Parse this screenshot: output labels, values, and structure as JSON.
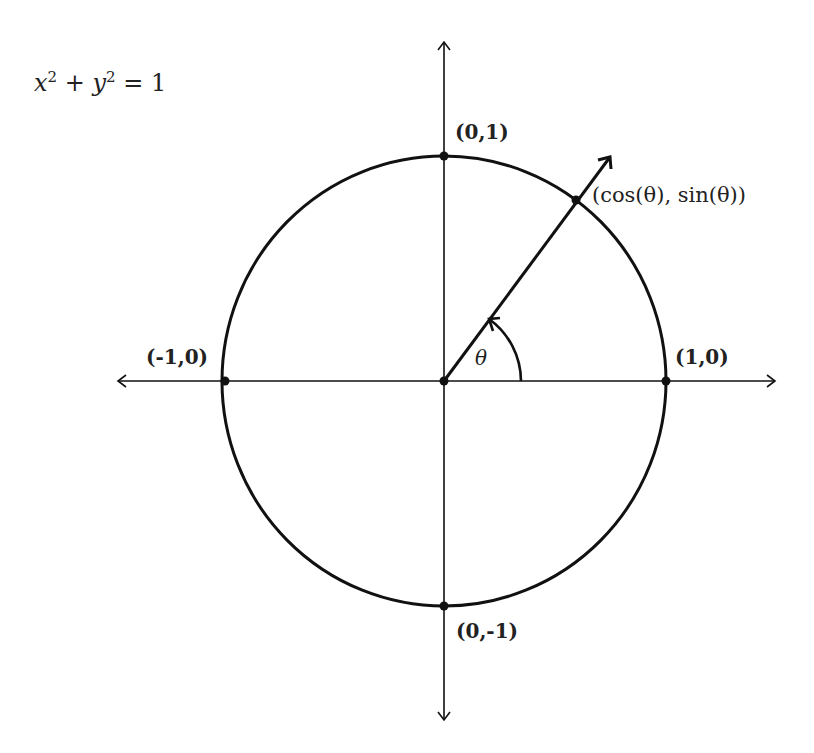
{
  "equation": {
    "x": "x",
    "y": "y",
    "exp": "2",
    "plus": " + ",
    "equals": " = 1"
  },
  "points": {
    "top": "(0,1)",
    "bottom": "(0,-1)",
    "left": "(-1,0)",
    "right": "(1,0)",
    "on_circle": "(cos(θ), sin(θ))"
  },
  "angle_label": "θ",
  "colors": {
    "stroke": "#111111",
    "text": "#222222",
    "background": "#ffffff"
  }
}
